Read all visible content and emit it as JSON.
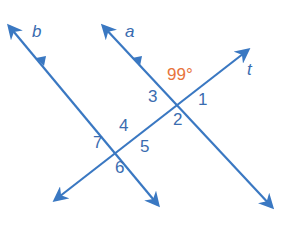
{
  "diagram": {
    "type": "parallel-lines-cut-by-transversal",
    "colors": {
      "line": "#3a78c2",
      "label": "#3a6cb0",
      "given_angle": "#e8743b"
    },
    "lines": [
      {
        "id": "b",
        "label": "b"
      },
      {
        "id": "a",
        "label": "a"
      },
      {
        "id": "t",
        "label": "t"
      }
    ],
    "given_angle": {
      "value": "99°"
    },
    "angle_labels": [
      "1",
      "2",
      "3",
      "4",
      "5",
      "6",
      "7"
    ]
  }
}
